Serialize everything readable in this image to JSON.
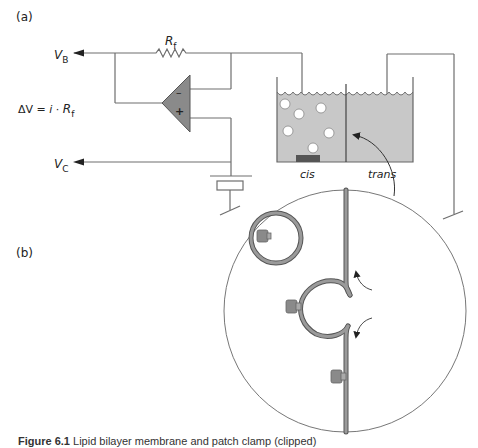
{
  "panels": {
    "a_label": "(a)",
    "b_label": "(b)"
  },
  "circuit": {
    "vb_main": "V",
    "vb_sub": "B",
    "vc_main": "V",
    "vc_sub": "C",
    "rf_main": "R",
    "rf_sub": "f",
    "equation_prefix": "ΔV = ",
    "equation_i": "i",
    "equation_dot": " · ",
    "equation_r": "R",
    "equation_sub": "f",
    "opamp_minus": "–",
    "opamp_plus": "+"
  },
  "bath": {
    "cis_label": "cis",
    "trans_label": "trans"
  },
  "caption": {
    "bold": "Figure 6.1",
    "text": "  Lipid bilayer membrane and patch clamp (clipped)"
  },
  "colors": {
    "line": "#6e6e6e",
    "wire": "#555555",
    "bath_fill": "#c8c8c8",
    "opamp_fill": "#8a8a8a",
    "membrane": "#8e8e8e",
    "protein": "#8a8a8a",
    "electrode_block": "#555555"
  }
}
